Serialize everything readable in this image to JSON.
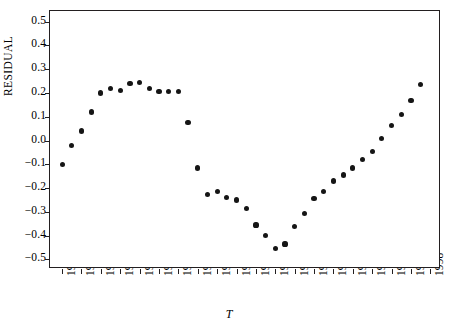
{
  "figure": {
    "type": "scatter-plot",
    "background_color": "#ffffff",
    "frame_color": "#231f20",
    "point_color": "#151515"
  },
  "axes": {
    "y_axis_title": "RESIDUAL",
    "x_axis_title": "T",
    "y_ticks": [
      "0.5",
      "0.4",
      "0.3",
      "0.2",
      "0.1",
      "0.0",
      "-0.1",
      "-0.2",
      "-0.3",
      "-0.4",
      "-0.5"
    ],
    "x_ticks": [
      "1960",
      "1962",
      "1964",
      "1966",
      "1968",
      "1970",
      "1972",
      "1974",
      "1976",
      "1978",
      "1980",
      "1982",
      "1984",
      "1986",
      "1988",
      "1990",
      "1992",
      "1994",
      "1996",
      "1998"
    ]
  },
  "chart_data": {
    "type": "scatter",
    "title": "",
    "xlabel": "T",
    "ylabel": "RESIDUAL",
    "xlim": [
      1959,
      1999
    ],
    "ylim": [
      -0.5,
      0.5
    ],
    "grid": false,
    "legend": "none",
    "x": [
      1960,
      1961,
      1962,
      1963,
      1964,
      1965,
      1966,
      1967,
      1968,
      1969,
      1970,
      1971,
      1972,
      1973,
      1974,
      1975,
      1976,
      1977,
      1978,
      1979,
      1980,
      1981,
      1982,
      1983,
      1984,
      1985,
      1986,
      1987,
      1988,
      1989,
      1990,
      1991,
      1992,
      1993,
      1994,
      1995,
      1996,
      1997
    ],
    "y": [
      -0.1,
      -0.02,
      0.04,
      0.12,
      0.2,
      0.22,
      0.21,
      0.24,
      0.245,
      0.22,
      0.205,
      0.205,
      0.205,
      0.075,
      -0.115,
      -0.225,
      -0.215,
      -0.24,
      -0.25,
      -0.285,
      -0.355,
      -0.4,
      -0.455,
      -0.435,
      -0.36,
      -0.305,
      -0.245,
      -0.215,
      -0.17,
      -0.145,
      -0.115,
      -0.08,
      -0.045,
      0.01,
      0.065,
      0.11,
      0.17,
      0.235,
      0.3,
      0.375,
      0.47
    ]
  }
}
